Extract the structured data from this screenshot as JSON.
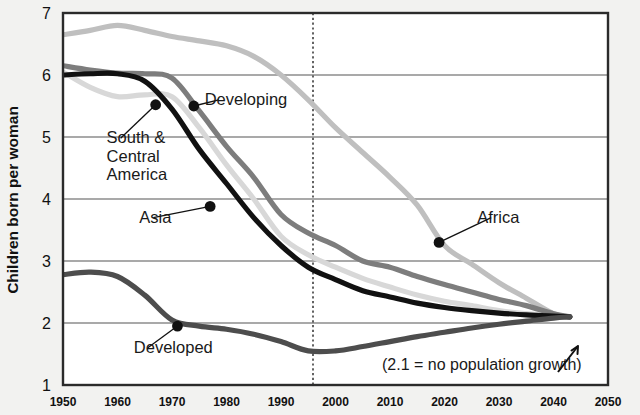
{
  "chart_data": {
    "type": "line",
    "title": "",
    "xlabel": "",
    "ylabel": "Children born per woman",
    "xlim": [
      1950,
      2050
    ],
    "ylim": [
      1,
      7
    ],
    "x_ticks": [
      "1950",
      "1960",
      "1970",
      "1980",
      "1990",
      "2000",
      "2010",
      "2020",
      "2030",
      "2040",
      "2050"
    ],
    "y_ticks": [
      "1",
      "2",
      "3",
      "4",
      "5",
      "6",
      "7"
    ],
    "grid": "horizontal",
    "legend": "inline-labels",
    "annotations": [
      {
        "name": "replacement-note",
        "text": "(2.1 = no population growth)",
        "x": 2020,
        "y": 1.35
      },
      {
        "name": "projection-divider",
        "text": "",
        "x": 1996,
        "style": "dotted-vertical"
      },
      {
        "name": "convergence-arrow",
        "text": "",
        "x": 2041,
        "y": 1.75
      }
    ],
    "series": [
      {
        "name": "Africa",
        "color": "#bfbfbf",
        "label": "Africa",
        "label_x": 2026,
        "label_y": 3.62,
        "marker": {
          "x": 2019,
          "y": 3.3
        },
        "x": [
          1950,
          1955,
          1960,
          1965,
          1970,
          1975,
          1980,
          1985,
          1990,
          1995,
          2000,
          2005,
          2010,
          2015,
          2020,
          2025,
          2030,
          2035,
          2040,
          2043
        ],
        "y": [
          6.65,
          6.72,
          6.8,
          6.72,
          6.62,
          6.55,
          6.47,
          6.3,
          6.0,
          5.6,
          5.15,
          4.75,
          4.35,
          3.9,
          3.25,
          2.95,
          2.65,
          2.4,
          2.15,
          2.1
        ]
      },
      {
        "name": "Developing",
        "color": "#7d7d7d",
        "label": "Developing",
        "label_x": 1976,
        "label_y": 5.52,
        "marker": {
          "x": 1974,
          "y": 5.5
        },
        "x": [
          1950,
          1955,
          1960,
          1965,
          1970,
          1975,
          1980,
          1985,
          1990,
          1995,
          2000,
          2005,
          2010,
          2015,
          2020,
          2025,
          2030,
          2035,
          2040,
          2043
        ],
        "y": [
          6.15,
          6.08,
          6.03,
          6.02,
          5.95,
          5.42,
          4.85,
          4.35,
          3.75,
          3.45,
          3.25,
          3.0,
          2.9,
          2.75,
          2.62,
          2.5,
          2.38,
          2.28,
          2.15,
          2.1
        ]
      },
      {
        "name": "South & Central America",
        "color": "#111111",
        "label": "South &\nCentral\nAmerica",
        "label_x": 1958,
        "label_y": 4.9,
        "marker": {
          "x": 1967,
          "y": 5.52
        },
        "x": [
          1950,
          1955,
          1960,
          1965,
          1970,
          1975,
          1980,
          1985,
          1990,
          1995,
          2000,
          2005,
          2010,
          2015,
          2020,
          2025,
          2030,
          2035,
          2040,
          2043
        ],
        "y": [
          6.0,
          6.02,
          6.02,
          5.9,
          5.45,
          4.8,
          4.25,
          3.7,
          3.25,
          2.9,
          2.7,
          2.52,
          2.42,
          2.32,
          2.25,
          2.2,
          2.16,
          2.13,
          2.11,
          2.1
        ]
      },
      {
        "name": "Asia",
        "color": "#d8d8d8",
        "label": "Asia",
        "label_x": 1964,
        "label_y": 3.62,
        "marker": {
          "x": 1977,
          "y": 3.88
        },
        "x": [
          1950,
          1955,
          1960,
          1965,
          1970,
          1975,
          1980,
          1985,
          1990,
          1995,
          2000,
          2005,
          2010,
          2015,
          2020,
          2025,
          2030,
          2035,
          2040,
          2043
        ],
        "y": [
          6.05,
          5.8,
          5.65,
          5.68,
          5.65,
          5.15,
          4.55,
          4.0,
          3.4,
          3.1,
          2.9,
          2.72,
          2.58,
          2.45,
          2.35,
          2.28,
          2.2,
          2.15,
          2.11,
          2.1
        ]
      },
      {
        "name": "Developed",
        "color": "#4d4d4d",
        "label": "Developed",
        "label_x": 1963,
        "label_y": 1.52,
        "marker": {
          "x": 1971,
          "y": 1.95
        },
        "x": [
          1950,
          1955,
          1960,
          1965,
          1970,
          1975,
          1980,
          1985,
          1990,
          1995,
          2000,
          2005,
          2010,
          2015,
          2020,
          2025,
          2030,
          2035,
          2040,
          2043
        ],
        "y": [
          2.78,
          2.82,
          2.75,
          2.45,
          2.05,
          1.95,
          1.9,
          1.82,
          1.7,
          1.55,
          1.55,
          1.62,
          1.7,
          1.78,
          1.85,
          1.92,
          1.98,
          2.03,
          2.08,
          2.1
        ]
      }
    ]
  }
}
